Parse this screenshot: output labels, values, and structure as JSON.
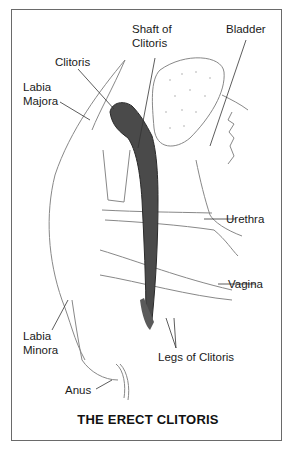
{
  "diagram": {
    "caption": "THE ERECT CLITORIS",
    "labels": {
      "shaft": "Shaft of\nClitoris",
      "bladder": "Bladder",
      "clitoris": "Clitoris",
      "labia_majora": "Labia\nMajora",
      "urethra": "Urethra",
      "vagina": "Vagina",
      "labia_minora": "Labia\nMinora",
      "legs": "Legs of Clitoris",
      "anus": "Anus"
    }
  }
}
